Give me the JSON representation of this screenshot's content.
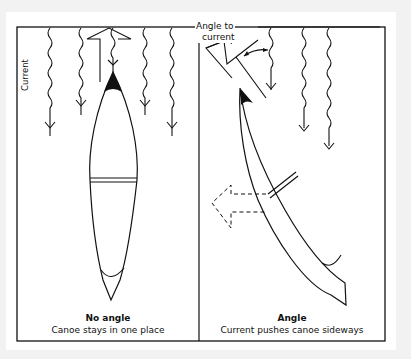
{
  "panels": [
    {
      "title": "No angle",
      "caption": "Canoe stays in one place"
    },
    {
      "title": "Angle",
      "caption": "Current pushes canoe sideways"
    }
  ],
  "labels": {
    "current": "Current",
    "angle_to_current_line1": "Angle to",
    "angle_to_current_line2": "current"
  },
  "colors": {
    "line": "#111111",
    "background": "#f2f2f2",
    "panel": "#ffffff"
  }
}
